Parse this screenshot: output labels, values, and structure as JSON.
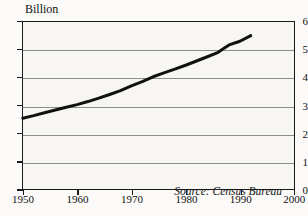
{
  "chart_data": {
    "type": "line",
    "title": "",
    "axis_unit_label": "Billion",
    "xlabel": "",
    "ylabel": "Billion",
    "xlim": [
      1950,
      2000
    ],
    "ylim": [
      0,
      6
    ],
    "xticks": [
      1950,
      1960,
      1970,
      1980,
      1990,
      2000
    ],
    "yticks": [
      0,
      1,
      2,
      3,
      4,
      5,
      6
    ],
    "xtick_labels": [
      "1950",
      "1960",
      "1970",
      "1980",
      "1990",
      "2000"
    ],
    "ytick_labels": [
      "0",
      "1",
      "2",
      "3",
      "4",
      "5",
      "6"
    ],
    "grid": true,
    "grid_axis": "y",
    "legend": false,
    "annotations": [
      {
        "text": "Source: Census Bureau",
        "position": "bottom-right",
        "style": "italic"
      }
    ],
    "series": [
      {
        "name": "World population",
        "color": "#111111",
        "linewidth": 3,
        "x": [
          1950,
          1952,
          1954,
          1956,
          1958,
          1960,
          1962,
          1964,
          1966,
          1968,
          1970,
          1972,
          1974,
          1976,
          1978,
          1980,
          1982,
          1984,
          1986,
          1987,
          1988,
          1990,
          1992
        ],
        "values": [
          2.55,
          2.64,
          2.74,
          2.84,
          2.94,
          3.03,
          3.14,
          3.26,
          3.39,
          3.53,
          3.7,
          3.85,
          4.02,
          4.16,
          4.29,
          4.43,
          4.58,
          4.73,
          4.89,
          5.02,
          5.15,
          5.28,
          5.48
        ]
      }
    ]
  },
  "axis": {
    "unit_label": "Billion",
    "y_labels": [
      "6",
      "5",
      "4",
      "3",
      "2",
      "1",
      "0"
    ],
    "x_labels": [
      "1950",
      "1960",
      "1970",
      "1980",
      "1990",
      "2000"
    ]
  },
  "source": {
    "note": "Source: Census Bureau"
  },
  "colors": {
    "line": "#111111",
    "grid": "#8d8d8d",
    "frame": "#1a1a1a",
    "plot_background": "#f7f6f3",
    "page_background": "#fbfaf8",
    "text": "#111111"
  }
}
